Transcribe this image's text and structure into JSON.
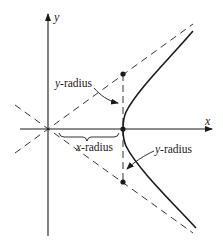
{
  "diagram": {
    "type": "hyperbola-with-asymptotes",
    "axes": {
      "x_label": "x",
      "y_label": "y"
    },
    "labels": {
      "y_radius_upper": {
        "var": "y",
        "text": "-radius"
      },
      "x_radius": {
        "var": "x",
        "text": "-radius"
      },
      "y_radius_lower": {
        "var": "y",
        "text": "-radius"
      }
    },
    "geometry": {
      "origin": [
        48,
        129
      ],
      "vertex": [
        123,
        129
      ],
      "x_radius_px": 75,
      "y_radius_px": 55,
      "points": [
        [
          123,
          74
        ],
        [
          123,
          129
        ],
        [
          123,
          182
        ]
      ]
    },
    "colors": {
      "stroke": "#1a1a1a",
      "background": "#ffffff"
    }
  }
}
